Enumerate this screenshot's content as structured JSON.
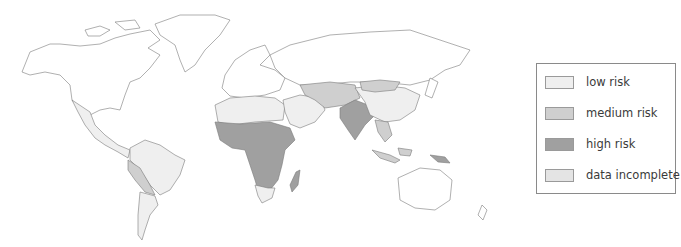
{
  "map": {
    "title": "",
    "region": "World",
    "colors": {
      "land_unshaded": "#ffffff",
      "low_risk": "#efefef",
      "medium_risk": "#cfcfcf",
      "high_risk": "#a0a0a0",
      "data_incomplete": "#e4e4e4",
      "border": "#7a7a7a"
    },
    "regions": [
      {
        "name": "North America",
        "category": "no data shown"
      },
      {
        "name": "Greenland",
        "category": "no data shown"
      },
      {
        "name": "Europe",
        "category": "no data shown"
      },
      {
        "name": "Russia",
        "category": "no data shown"
      },
      {
        "name": "Australia",
        "category": "no data shown"
      },
      {
        "name": "Mexico & Central America",
        "category": "low risk"
      },
      {
        "name": "Northern South America / Brazil",
        "category": "low risk"
      },
      {
        "name": "Peru / Bolivia / Paraguay",
        "category": "medium risk"
      },
      {
        "name": "Southern South America",
        "category": "low risk"
      },
      {
        "name": "North Africa",
        "category": "low risk"
      },
      {
        "name": "Sub-Saharan Africa",
        "category": "high risk"
      },
      {
        "name": "Southern Africa",
        "category": "low risk"
      },
      {
        "name": "Madagascar",
        "category": "high risk"
      },
      {
        "name": "Middle East",
        "category": "low risk"
      },
      {
        "name": "Central Asia",
        "category": "medium risk"
      },
      {
        "name": "India / South Asia",
        "category": "high risk"
      },
      {
        "name": "China",
        "category": "low risk"
      },
      {
        "name": "Mongolia",
        "category": "medium risk"
      },
      {
        "name": "Southeast Asia",
        "category": "medium risk"
      },
      {
        "name": "Indonesia",
        "category": "medium risk"
      },
      {
        "name": "Papua New Guinea",
        "category": "high risk"
      }
    ]
  },
  "legend": {
    "items": [
      {
        "label": "low risk",
        "color": "#efefef"
      },
      {
        "label": "medium risk",
        "color": "#cfcfcf"
      },
      {
        "label": "high risk",
        "color": "#a0a0a0"
      },
      {
        "label": "data incomplete",
        "color": "#e4e4e4"
      }
    ]
  }
}
